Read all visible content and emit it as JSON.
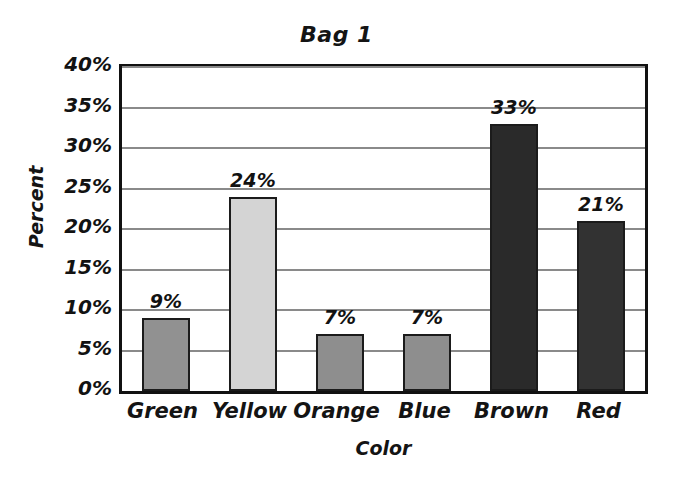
{
  "chart_data": {
    "type": "bar",
    "title": "Bag 1",
    "xlabel": "Color",
    "ylabel": "Percent",
    "categories": [
      "Green",
      "Yellow",
      "Orange",
      "Blue",
      "Brown",
      "Red"
    ],
    "values": [
      9,
      24,
      7,
      7,
      33,
      21
    ],
    "value_labels": [
      "9%",
      "24%",
      "7%",
      "7%",
      "33%",
      "21%"
    ],
    "ylim": [
      0,
      40
    ],
    "ytick_values": [
      0,
      5,
      10,
      15,
      20,
      25,
      30,
      35,
      40
    ],
    "ytick_labels": [
      "0%",
      "5%",
      "10%",
      "15%",
      "20%",
      "25%",
      "30%",
      "35%",
      "40%"
    ],
    "grid": true,
    "grid_axis": "y",
    "legend": false,
    "legend_position": "none",
    "bar_colors": [
      "#919191",
      "#d4d4d4",
      "#8e8e8e",
      "#8e8e8e",
      "#2a2a2a",
      "#323232"
    ],
    "bar_border_color": "#1b1b1b",
    "gridline_color": "#8a8a8a",
    "frame_color": "#111111",
    "background_color": "#ffffff",
    "text_color": "#141414"
  }
}
